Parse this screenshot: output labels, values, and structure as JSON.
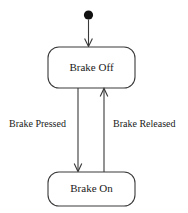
{
  "diagram": {
    "type": "uml-state-machine",
    "background_color": "#ffffff",
    "line_color": "#3a3a3a",
    "text_color": "#1a1a1a",
    "initial_node": {
      "name": "initial-state",
      "shape": "filled-circle",
      "color": "#111111",
      "cx": 88.5,
      "cy": 15,
      "r": 4.5
    },
    "states": [
      {
        "id": "brake-off",
        "label": "Brake Off",
        "x": 48,
        "y": 47,
        "width": 87,
        "height": 41,
        "rx": 11
      },
      {
        "id": "brake-on",
        "label": "Brake On",
        "x": 48,
        "y": 172,
        "width": 87,
        "height": 34,
        "rx": 11
      }
    ],
    "transitions": [
      {
        "id": "start-to-brake-off",
        "label": "",
        "from": "initial-state",
        "to": "brake-off",
        "direction": "down",
        "x": 88.5,
        "y_start": 20,
        "y_end": 47
      },
      {
        "id": "brake-off-to-brake-on",
        "label": "Brake Pressed",
        "from": "brake-off",
        "to": "brake-on",
        "direction": "down",
        "x": 78,
        "y_start": 88,
        "y_end": 172,
        "label_x": 9,
        "label_y": 125
      },
      {
        "id": "brake-on-to-brake-off",
        "label": "Brake Released",
        "from": "brake-on",
        "to": "brake-off",
        "direction": "up",
        "x": 104,
        "y_start": 172,
        "y_end": 88,
        "label_x": 113,
        "label_y": 125
      }
    ]
  }
}
